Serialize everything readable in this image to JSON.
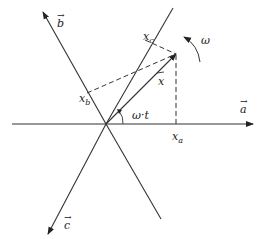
{
  "diagram": {
    "axes": [
      {
        "id": "a",
        "label": "a",
        "vector_arrow": "→"
      },
      {
        "id": "b",
        "label": "b",
        "vector_arrow": "→"
      },
      {
        "id": "c",
        "label": "c",
        "vector_arrow": "→"
      }
    ],
    "vector": {
      "label": "x",
      "arrow": "⇀"
    },
    "projections": [
      {
        "label_main": "x",
        "label_sub": "a"
      },
      {
        "label_main": "x",
        "label_sub": "b"
      },
      {
        "label_main": "x",
        "label_sub": "c"
      }
    ],
    "angle_label": "ω·t",
    "rotation_label": "ω",
    "colors": {
      "line": "#333333",
      "background": "#ffffff"
    }
  }
}
